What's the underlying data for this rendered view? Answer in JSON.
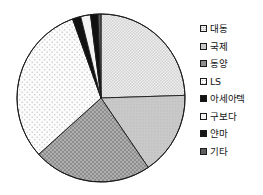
{
  "chart_data": {
    "type": "pie",
    "title": "",
    "subtitle": "",
    "xlabel": "",
    "ylabel": "",
    "grid": false,
    "legend_position": "right",
    "start_angle_deg": 0,
    "direction": "clockwise",
    "categories": [
      "대동",
      "국제",
      "동양",
      "LS",
      "아세아텍",
      "구보다",
      "얀마",
      "기타"
    ],
    "values": [
      24.5,
      16.0,
      22.8,
      31.2,
      1.6,
      1.9,
      1.4,
      0.6
    ],
    "slices": [
      {
        "label": "대동",
        "value": 24.5,
        "start_deg": 0.0,
        "end_deg": 88.2,
        "fill": "#ececec",
        "pattern": "fine-checker",
        "swatch_class": "sw-daedong"
      },
      {
        "label": "국제",
        "value": 16.0,
        "start_deg": 88.2,
        "end_deg": 145.8,
        "fill": "#c9c9c9",
        "pattern": "solid-light-gray",
        "swatch_class": "sw-kukje"
      },
      {
        "label": "동양",
        "value": 22.8,
        "start_deg": 145.8,
        "end_deg": 227.9,
        "fill": "#8e8e8e",
        "pattern": "dark-dotted",
        "swatch_class": "sw-dongyang"
      },
      {
        "label": "LS",
        "value": 31.2,
        "start_deg": 227.9,
        "end_deg": 340.2,
        "fill": "#fbfbfb",
        "pattern": "sparse-dots",
        "swatch_class": "sw-ls"
      },
      {
        "label": "아세아텍",
        "value": 1.6,
        "start_deg": 340.2,
        "end_deg": 346.0,
        "fill": "#111111",
        "pattern": "solid-black",
        "swatch_class": "sw-asia"
      },
      {
        "label": "구보다",
        "value": 1.9,
        "start_deg": 346.0,
        "end_deg": 352.8,
        "fill": "#f2f2f2",
        "pattern": "solid-white",
        "swatch_class": "sw-kubota"
      },
      {
        "label": "얀마",
        "value": 1.4,
        "start_deg": 352.8,
        "end_deg": 357.9,
        "fill": "#161616",
        "pattern": "solid-black",
        "swatch_class": "sw-yanmar"
      },
      {
        "label": "기타",
        "value": 0.6,
        "start_deg": 357.9,
        "end_deg": 360.0,
        "fill": "#5e5e5e",
        "pattern": "solid-gray",
        "swatch_class": "sw-etc"
      }
    ]
  },
  "legend": {
    "items": [
      {
        "label": "대동",
        "swatch_class": "sw-daedong"
      },
      {
        "label": "국제",
        "swatch_class": "sw-kukje"
      },
      {
        "label": "동양",
        "swatch_class": "sw-dongyang"
      },
      {
        "label": "LS",
        "swatch_class": "sw-ls"
      },
      {
        "label": "아세아텍",
        "swatch_class": "sw-asia"
      },
      {
        "label": "구보다",
        "swatch_class": "sw-kubota"
      },
      {
        "label": "얀마",
        "swatch_class": "sw-yanmar"
      },
      {
        "label": "기타",
        "swatch_class": "sw-etc"
      }
    ]
  },
  "colors": {
    "outline": "#1a1a1a",
    "background": "#ffffff",
    "text": "#151515"
  }
}
